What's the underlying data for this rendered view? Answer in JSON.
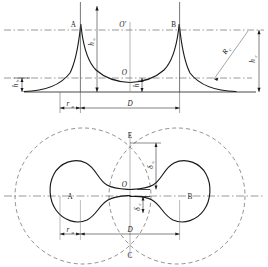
{
  "figure": {
    "type": "technical-diagram",
    "panels": [
      {
        "id": "upper",
        "name": "elevation-profile",
        "labels": {
          "peak_left": "A",
          "peak_right": "B",
          "midpoint_top": "O'",
          "midpoint_curve": "O",
          "height_peak": "h",
          "height_peak_sub": "a",
          "height_mid": "h",
          "height_mid_sub": "0",
          "height_edge": "h",
          "height_edge_sub": "b",
          "radius_slant": "R",
          "radius_slant_sub": "c",
          "height_right": "h",
          "height_right_sub": "c",
          "dim_ra": "r",
          "dim_ra_sub": "a",
          "dim_D": "D"
        }
      },
      {
        "id": "lower",
        "name": "plan-view",
        "labels": {
          "lobe_left": "A",
          "lobe_right": "B",
          "center": "O",
          "top": "E",
          "bottom": "C",
          "delta_upper": "δ",
          "delta_upper_sub": "a",
          "delta_lower": "δ",
          "delta_lower_sub": "c",
          "dim_ra": "r",
          "dim_ra_sub": "a",
          "dim_D": "D"
        }
      }
    ],
    "colors": {
      "line": "#1a1a1a",
      "dashed": "#555555",
      "background": "#ffffff"
    }
  }
}
